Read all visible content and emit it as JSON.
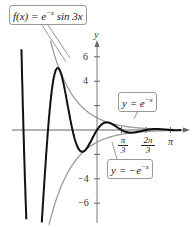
{
  "chart_data": {
    "type": "line",
    "title": "",
    "xlabel": "",
    "ylabel": "y",
    "xlim": [
      -3.6,
      3.6
    ],
    "ylim": [
      -7.5,
      8
    ],
    "grid": false,
    "x_ticks": [
      {
        "value": 1.0472,
        "label_num": "π",
        "label_den": "3"
      },
      {
        "value": 2.0944,
        "label_num": "2π",
        "label_den": "3"
      },
      {
        "value": 3.1416,
        "label": "π"
      }
    ],
    "y_ticks": [
      {
        "value": 6,
        "label": "6"
      },
      {
        "value": 4,
        "label": "4"
      },
      {
        "value": 2,
        "label": ""
      },
      {
        "value": -2,
        "label": ""
      },
      {
        "value": -4,
        "label": "−4"
      },
      {
        "value": -6,
        "label": "−6"
      }
    ],
    "series": [
      {
        "name": "f(x) = e^(−x) sin 3x",
        "expression": "exp(-x)*sin(3*x)",
        "color": "#111111",
        "width": 2
      },
      {
        "name": "y = e^(−x)",
        "expression": "exp(-x)",
        "color": "#9a9a9a",
        "width": 1.3
      },
      {
        "name": "y = −e^(−x)",
        "expression": "-exp(-x)",
        "color": "#9a9a9a",
        "width": 1.3
      }
    ],
    "annotations": [
      {
        "text": "f(x) = e^(−x) sin 3x",
        "target": "f(x) curve near x≈-1.5"
      },
      {
        "text": "y = e^(−x)",
        "target": "upper envelope near x≈0.5"
      },
      {
        "text": "y = −e^(−x)",
        "target": "lower envelope near x≈0.5"
      }
    ]
  },
  "labels": {
    "y_axis": "y",
    "f_label": "f(x) = e",
    "f_exp": "−x",
    "f_tail": " sin 3x",
    "upper_label": "y = e",
    "upper_exp": "−x",
    "lower_label": "y = −e",
    "lower_exp": "−x",
    "tick_6": "6",
    "tick_4": "4",
    "tick_m4": "−4",
    "tick_m6": "−6",
    "pi3_num": "π",
    "pi3_den": "3",
    "twopi3_num": "2π",
    "twopi3_den": "3",
    "pi": "π"
  }
}
